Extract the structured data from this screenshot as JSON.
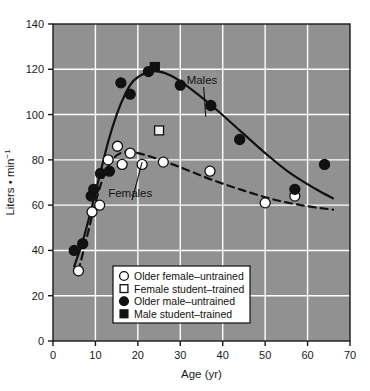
{
  "chart_data": {
    "type": "scatter",
    "title": "",
    "xlabel": "Age (yr)",
    "ylabel": "Liters • min⁻¹",
    "ylabel_base": "Liters • min",
    "ylabel_exponent": "−1",
    "xlim": [
      0,
      70
    ],
    "ylim": [
      0,
      140
    ],
    "xticks": [
      0,
      10,
      20,
      30,
      40,
      50,
      60,
      70
    ],
    "yticks": [
      0,
      20,
      40,
      60,
      80,
      100,
      120,
      140
    ],
    "grid": true,
    "plot_bg": "#919191",
    "grid_color": "#ffffff",
    "axis_color": "#1a1a1a",
    "legend_position": "lower-center-inside",
    "annotations": [
      {
        "name": "males-label",
        "text": "Males",
        "x": 31.5,
        "y": 113.5,
        "leader_to_x": 36.0,
        "leader_to_y": 99.0
      },
      {
        "name": "females-label",
        "text": "Females",
        "x": 13.0,
        "y": 63.5,
        "leader_to_x": 21.0,
        "leader_to_y": 79.0
      }
    ],
    "series": [
      {
        "name": "Older female–untrained",
        "marker": "open-circle",
        "marker_fill": "#ffffff",
        "marker_edge": "#111111",
        "points": [
          {
            "x": 6.0,
            "y": 31.0
          },
          {
            "x": 9.2,
            "y": 57.0
          },
          {
            "x": 11.0,
            "y": 60.0
          },
          {
            "x": 13.0,
            "y": 80.0
          },
          {
            "x": 15.2,
            "y": 86.0
          },
          {
            "x": 16.3,
            "y": 78.0
          },
          {
            "x": 18.2,
            "y": 83.0
          },
          {
            "x": 21.0,
            "y": 78.0
          },
          {
            "x": 26.0,
            "y": 79.0
          },
          {
            "x": 37.0,
            "y": 75.0
          },
          {
            "x": 50.0,
            "y": 61.0
          },
          {
            "x": 57.0,
            "y": 64.0
          }
        ]
      },
      {
        "name": "Female student–trained",
        "marker": "open-square",
        "marker_fill": "#f2f2f2",
        "marker_edge": "#111111",
        "points": [
          {
            "x": 25.0,
            "y": 93.0
          }
        ]
      },
      {
        "name": "Older male–untrained",
        "marker": "filled-circle",
        "marker_fill": "#111111",
        "marker_edge": "#111111",
        "points": [
          {
            "x": 5.0,
            "y": 40.0
          },
          {
            "x": 7.0,
            "y": 43.0
          },
          {
            "x": 9.0,
            "y": 64.0
          },
          {
            "x": 9.6,
            "y": 67.0
          },
          {
            "x": 11.2,
            "y": 74.0
          },
          {
            "x": 13.3,
            "y": 75.0
          },
          {
            "x": 16.0,
            "y": 114.0
          },
          {
            "x": 18.2,
            "y": 109.0
          },
          {
            "x": 22.5,
            "y": 119.0
          },
          {
            "x": 30.0,
            "y": 113.0
          },
          {
            "x": 37.2,
            "y": 104.0
          },
          {
            "x": 44.0,
            "y": 89.0
          },
          {
            "x": 57.0,
            "y": 67.0
          },
          {
            "x": 64.0,
            "y": 78.0
          }
        ]
      },
      {
        "name": "Male student–trained",
        "marker": "filled-square",
        "marker_fill": "#111111",
        "marker_edge": "#111111",
        "points": [
          {
            "x": 24.0,
            "y": 121.0
          }
        ]
      }
    ],
    "curves": [
      {
        "name": "males-trend",
        "label": "Males",
        "style": "solid",
        "color": "#111111",
        "width": 2.2,
        "points": [
          {
            "x": 5.0,
            "y": 33.0
          },
          {
            "x": 7.0,
            "y": 44.0
          },
          {
            "x": 9.0,
            "y": 58.0
          },
          {
            "x": 11.0,
            "y": 73.0
          },
          {
            "x": 13.0,
            "y": 88.0
          },
          {
            "x": 15.0,
            "y": 100.0
          },
          {
            "x": 17.0,
            "y": 109.0
          },
          {
            "x": 19.0,
            "y": 115.0
          },
          {
            "x": 22.0,
            "y": 118.5
          },
          {
            "x": 25.0,
            "y": 119.0
          },
          {
            "x": 28.0,
            "y": 117.0
          },
          {
            "x": 32.0,
            "y": 112.0
          },
          {
            "x": 38.0,
            "y": 103.0
          },
          {
            "x": 44.0,
            "y": 93.0
          },
          {
            "x": 50.0,
            "y": 83.0
          },
          {
            "x": 56.0,
            "y": 74.0
          },
          {
            "x": 62.0,
            "y": 67.0
          },
          {
            "x": 66.0,
            "y": 63.0
          }
        ]
      },
      {
        "name": "females-trend",
        "label": "Females",
        "style": "dashed",
        "color": "#111111",
        "width": 2.2,
        "points": [
          {
            "x": 6.0,
            "y": 31.0
          },
          {
            "x": 8.0,
            "y": 46.0
          },
          {
            "x": 10.0,
            "y": 61.0
          },
          {
            "x": 12.0,
            "y": 73.0
          },
          {
            "x": 14.0,
            "y": 80.0
          },
          {
            "x": 16.0,
            "y": 83.0
          },
          {
            "x": 18.5,
            "y": 83.5
          },
          {
            "x": 22.0,
            "y": 82.0
          },
          {
            "x": 26.0,
            "y": 79.5
          },
          {
            "x": 31.0,
            "y": 76.0
          },
          {
            "x": 37.0,
            "y": 71.5
          },
          {
            "x": 44.0,
            "y": 67.0
          },
          {
            "x": 52.0,
            "y": 62.5
          },
          {
            "x": 60.0,
            "y": 59.5
          },
          {
            "x": 66.0,
            "y": 58.0
          }
        ]
      }
    ],
    "legend": {
      "items": [
        {
          "marker": "open-circle",
          "label": "Older female–untrained"
        },
        {
          "marker": "open-square",
          "label": "Female student–trained"
        },
        {
          "marker": "filled-circle",
          "label": "Older male–untrained"
        },
        {
          "marker": "filled-square",
          "label": "Male student–trained"
        }
      ]
    }
  }
}
